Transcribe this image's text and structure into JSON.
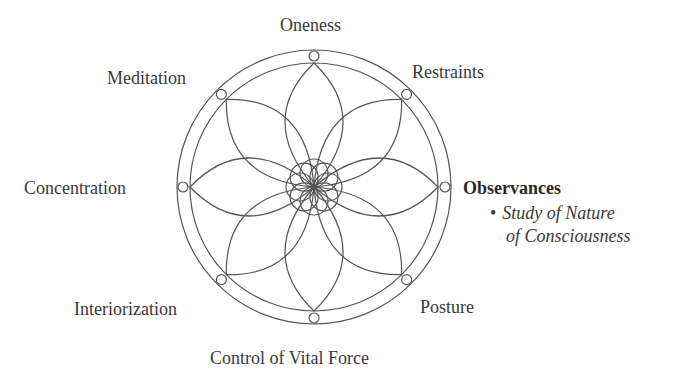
{
  "diagram": {
    "type": "eight-limbed lotus wheel",
    "center": [
      314,
      187
    ],
    "outer_radius": 137,
    "inner_radius": 124,
    "node_radius": 131,
    "stroke_color": "#555555",
    "labels": {
      "top": "Oneness",
      "top_right": "Restraints",
      "right": "Observances",
      "bottom_right": "Posture",
      "bottom": "Control of Vital Force",
      "bottom_left": "Interiorization",
      "left": "Concentration",
      "top_left": "Meditation"
    },
    "highlight": {
      "heading": "Observances",
      "bullet": "•",
      "line1": "Study of Nature",
      "line2": "of Consciousness"
    }
  }
}
